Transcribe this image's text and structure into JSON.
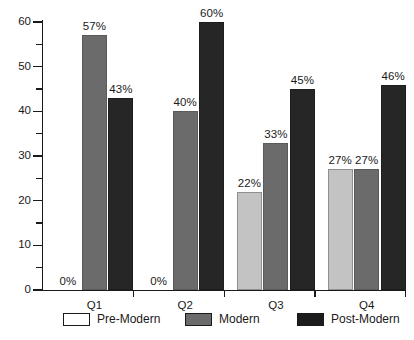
{
  "chart_data": {
    "type": "bar",
    "title": "",
    "subtitle": "",
    "xlabel": "",
    "ylabel": "",
    "ylim": [
      0,
      60
    ],
    "ytick_values": [
      0,
      10,
      20,
      30,
      40,
      50,
      60
    ],
    "ytick_labels": [
      "0",
      "10",
      "20",
      "30",
      "40",
      "50",
      "60"
    ],
    "yminor_values": [
      5,
      15,
      25,
      35,
      45,
      55
    ],
    "grid": false,
    "legend_position": "bottom",
    "categories": [
      "Q1",
      "Q2",
      "Q3",
      "Q4"
    ],
    "series": [
      {
        "name": "Pre-Modern",
        "color": "#ffffff",
        "bar_color": "#c3c3c3",
        "values": [
          0,
          0,
          22,
          27
        ],
        "labels": [
          "0%",
          "0%",
          "22%",
          "27%"
        ]
      },
      {
        "name": "Modern",
        "color": "#6b6b6b",
        "bar_color": "#6b6b6b",
        "values": [
          57,
          40,
          33,
          27
        ],
        "labels": [
          "57%",
          "40%",
          "33%",
          "27%"
        ]
      },
      {
        "name": "Post-Modern",
        "color": "#262626",
        "bar_color": "#262626",
        "values": [
          43,
          60,
          45,
          46
        ],
        "labels": [
          "43%",
          "60%",
          "45%",
          "46%"
        ]
      }
    ]
  },
  "legend": {
    "items": [
      {
        "label": "Pre-Modern"
      },
      {
        "label": "Modern"
      },
      {
        "label": "Post-Modern"
      }
    ]
  }
}
